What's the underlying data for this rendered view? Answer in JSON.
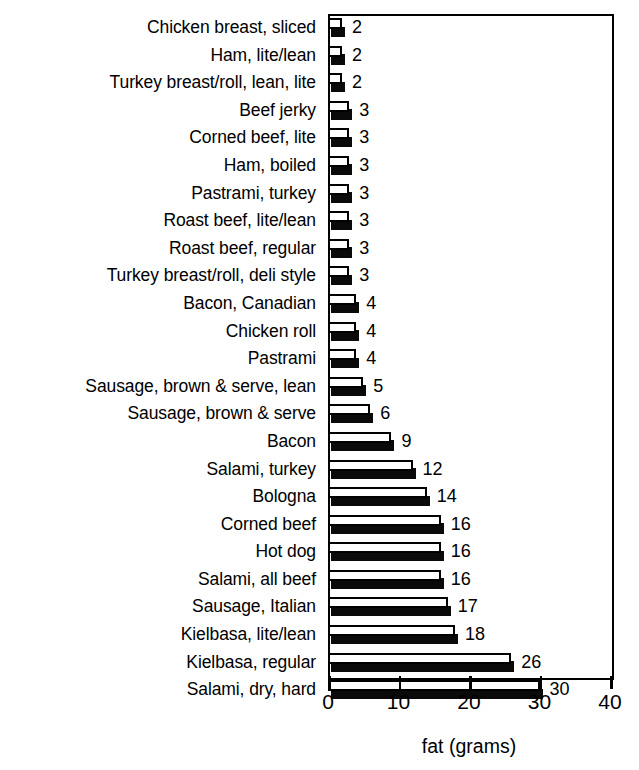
{
  "chart_data": {
    "type": "bar",
    "orientation": "horizontal",
    "title": "",
    "xlabel": "fat (grams)",
    "ylabel": "",
    "xlim": [
      0,
      40
    ],
    "xticks": [
      0,
      10,
      20,
      30,
      40
    ],
    "xtick_labels": [
      "0",
      "10",
      "20",
      "30",
      "40"
    ],
    "grid": false,
    "legend": false,
    "categories": [
      "Chicken breast, sliced",
      "Ham, lite/lean",
      "Turkey breast/roll, lean, lite",
      "Beef jerky",
      "Corned beef, lite",
      "Ham, boiled",
      "Pastrami, turkey",
      "Roast beef, lite/lean",
      "Roast beef, regular",
      "Turkey breast/roll, deli style",
      "Bacon, Canadian",
      "Chicken roll",
      "Pastrami",
      "Sausage, brown & serve, lean",
      "Sausage, brown & serve",
      "Bacon",
      "Salami, turkey",
      "Bologna",
      "Corned beef",
      "Hot dog",
      "Salami, all beef",
      "Sausage, Italian",
      "Kielbasa, lite/lean",
      "Kielbasa, regular",
      "Salami, dry, hard"
    ],
    "values": [
      2,
      2,
      2,
      3,
      3,
      3,
      3,
      3,
      3,
      3,
      4,
      4,
      4,
      5,
      6,
      9,
      12,
      14,
      16,
      16,
      16,
      17,
      18,
      26,
      30
    ],
    "value_labels": [
      "2",
      "2",
      "2",
      "3",
      "3",
      "3",
      "3",
      "3",
      "3",
      "3",
      "4",
      "4",
      "4",
      "5",
      "6",
      "9",
      "12",
      "14",
      "16",
      "16",
      "16",
      "17",
      "18",
      "26",
      "30"
    ],
    "bar_face_color": "#ffffff",
    "bar_edge_color": "#000000",
    "bar_shadow_color": "#0a0a0a",
    "axis_color": "#000000",
    "background_color": "#ffffff"
  }
}
